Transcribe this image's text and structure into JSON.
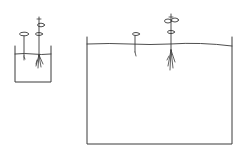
{
  "diagram": {
    "containers": [
      {
        "id": "small",
        "label": "small container",
        "seedlings": [
          "small seedling",
          "tall seedling"
        ]
      },
      {
        "id": "large",
        "label": "large container",
        "seedlings": [
          "small seedling",
          "tall seedling"
        ]
      }
    ],
    "colors": {
      "ink": "#3a3a3a",
      "background": "#ffffff"
    }
  }
}
